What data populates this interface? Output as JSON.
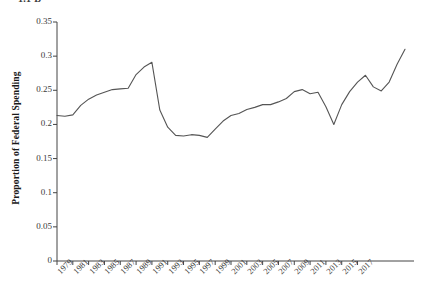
{
  "clipped_header": "1.1  D",
  "chart_data": {
    "type": "line",
    "title": "",
    "xlabel": "",
    "ylabel": "Proportion of Federal Spending",
    "xlim": [
      1979,
      2018
    ],
    "ylim": [
      0,
      0.35
    ],
    "grid": false,
    "legend": null,
    "line_color": "#555555",
    "x_tick_labels": [
      "1979",
      "1981",
      "1983",
      "1985",
      "1987",
      "1989",
      "1991",
      "1993",
      "1995",
      "1997",
      "1999",
      "2001",
      "2003",
      "2005",
      "2007",
      "2009",
      "2011",
      "2013",
      "2015",
      "2017"
    ],
    "y_tick_labels": [
      "0",
      "0.05",
      "0.1",
      "0.15",
      "0.2",
      "0.25",
      "0.3",
      "0.35"
    ],
    "y_tick_values": [
      0,
      0.05,
      0.1,
      0.15,
      0.2,
      0.25,
      0.3,
      0.35
    ],
    "x": [
      1979,
      1980,
      1981,
      1982,
      1983,
      1984,
      1985,
      1986,
      1987,
      1988,
      1989,
      1990,
      1991,
      1992,
      1993,
      1994,
      1995,
      1996,
      1997,
      1998,
      1999,
      2000,
      2001,
      2002,
      2003,
      2004,
      2005,
      2006,
      2007,
      2008,
      2009,
      2010,
      2011,
      2012,
      2013,
      2014,
      2015,
      2016,
      2017,
      2018
    ],
    "values": [
      0.213,
      0.212,
      0.216,
      0.228,
      0.237,
      0.242,
      0.247,
      0.251,
      0.252,
      0.253,
      0.272,
      0.288,
      0.291,
      0.221,
      0.196,
      0.184,
      0.183,
      0.185,
      0.184,
      0.181,
      0.193,
      0.205,
      0.213,
      0.216,
      0.222,
      0.225,
      0.229,
      0.229,
      0.232,
      0.237,
      0.247,
      0.25,
      0.244,
      0.247,
      0.226,
      0.2,
      0.228,
      0.241,
      0.253,
      0.271
    ],
    "values_tail": [
      0.255,
      0.249,
      0.262,
      0.288,
      0.31
    ],
    "x_tail": [
      2014,
      2015,
      2016,
      2017,
      2018
    ],
    "series": [
      {
        "name": "Proportion of Federal Spending",
        "points": [
          {
            "x": 1979,
            "y": 0.213
          },
          {
            "x": 1980,
            "y": 0.212
          },
          {
            "x": 1981,
            "y": 0.214
          },
          {
            "x": 1982,
            "y": 0.228
          },
          {
            "x": 1983,
            "y": 0.237
          },
          {
            "x": 1984,
            "y": 0.243
          },
          {
            "x": 1985,
            "y": 0.247
          },
          {
            "x": 1986,
            "y": 0.251
          },
          {
            "x": 1987,
            "y": 0.252
          },
          {
            "x": 1988,
            "y": 0.253
          },
          {
            "x": 1989,
            "y": 0.273
          },
          {
            "x": 1990,
            "y": 0.284
          },
          {
            "x": 1991,
            "y": 0.291
          },
          {
            "x": 1992,
            "y": 0.221
          },
          {
            "x": 1993,
            "y": 0.196
          },
          {
            "x": 1994,
            "y": 0.184
          },
          {
            "x": 1995,
            "y": 0.183
          },
          {
            "x": 1996,
            "y": 0.185
          },
          {
            "x": 1997,
            "y": 0.184
          },
          {
            "x": 1998,
            "y": 0.181
          },
          {
            "x": 1999,
            "y": 0.193
          },
          {
            "x": 2000,
            "y": 0.205
          },
          {
            "x": 2001,
            "y": 0.213
          },
          {
            "x": 2002,
            "y": 0.216
          },
          {
            "x": 2003,
            "y": 0.222
          },
          {
            "x": 2004,
            "y": 0.225
          },
          {
            "x": 2005,
            "y": 0.229
          },
          {
            "x": 2006,
            "y": 0.229
          },
          {
            "x": 2007,
            "y": 0.233
          },
          {
            "x": 2008,
            "y": 0.238
          },
          {
            "x": 2009,
            "y": 0.248
          },
          {
            "x": 2010,
            "y": 0.251
          },
          {
            "x": 2011,
            "y": 0.245
          },
          {
            "x": 2012,
            "y": 0.247
          },
          {
            "x": 2013,
            "y": 0.226
          },
          {
            "x": 2014,
            "y": 0.2
          },
          {
            "x": 2015,
            "y": 0.229
          },
          {
            "x": 2016,
            "y": 0.248
          },
          {
            "x": 2017,
            "y": 0.262
          },
          {
            "x": 2018,
            "y": 0.272
          },
          {
            "x": 2019,
            "y": 0.255
          },
          {
            "x": 2020,
            "y": 0.249
          },
          {
            "x": 2021,
            "y": 0.262
          },
          {
            "x": 2022,
            "y": 0.288
          },
          {
            "x": 2023,
            "y": 0.31
          }
        ]
      }
    ]
  },
  "axes": {
    "y_axis_label": "Proportion of Federal Spending"
  }
}
